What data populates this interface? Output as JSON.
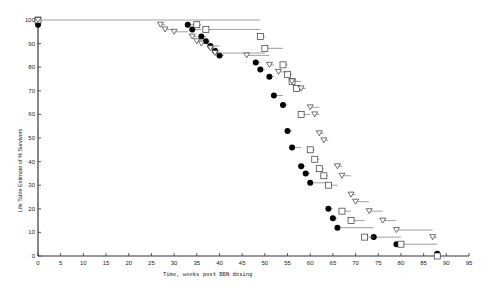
{
  "chart_data": {
    "type": "scatter",
    "title": "",
    "xlabel": "Time, weeks post BBN dosing",
    "ylabel": "Life Table Estimate of % Survivors",
    "xlim": [
      0,
      95
    ],
    "ylim": [
      0,
      100
    ],
    "x_ticks": [
      0,
      5,
      10,
      15,
      20,
      25,
      30,
      35,
      40,
      45,
      50,
      55,
      60,
      65,
      70,
      75,
      80,
      85,
      90,
      95
    ],
    "y_ticks": [
      0,
      10,
      20,
      30,
      40,
      50,
      60,
      70,
      80,
      90,
      100
    ],
    "grid": false,
    "legend": null,
    "series": [
      {
        "name": "filled-circle",
        "marker": "circle",
        "points": [
          {
            "x": 0,
            "y": 98,
            "end": 0
          },
          {
            "x": 33,
            "y": 98,
            "end": 35
          },
          {
            "x": 34,
            "y": 96,
            "end": 36
          },
          {
            "x": 36,
            "y": 93,
            "end": 37
          },
          {
            "x": 37,
            "y": 91,
            "end": 38
          },
          {
            "x": 38,
            "y": 89,
            "end": 40
          },
          {
            "x": 39,
            "y": 87,
            "end": 40
          },
          {
            "x": 40,
            "y": 85,
            "end": 41
          },
          {
            "x": 48,
            "y": 82,
            "end": 49
          },
          {
            "x": 49,
            "y": 79,
            "end": 50
          },
          {
            "x": 51,
            "y": 76,
            "end": 52
          },
          {
            "x": 52,
            "y": 68,
            "end": 54
          },
          {
            "x": 54,
            "y": 64,
            "end": 55
          },
          {
            "x": 55,
            "y": 53,
            "end": 56
          },
          {
            "x": 56,
            "y": 46,
            "end": 58
          },
          {
            "x": 58,
            "y": 38,
            "end": 59
          },
          {
            "x": 59,
            "y": 35,
            "end": 60
          },
          {
            "x": 60,
            "y": 31,
            "end": 64
          },
          {
            "x": 64,
            "y": 20,
            "end": 65
          },
          {
            "x": 65,
            "y": 16,
            "end": 66
          },
          {
            "x": 66,
            "y": 12,
            "end": 74
          },
          {
            "x": 74,
            "y": 8,
            "end": 80
          },
          {
            "x": 79,
            "y": 5,
            "end": 80
          },
          {
            "x": 88,
            "y": 1,
            "end": 88
          }
        ]
      },
      {
        "name": "open-square",
        "marker": "square",
        "points": [
          {
            "x": 0,
            "y": 100,
            "end": 49
          },
          {
            "x": 35,
            "y": 98,
            "end": 36
          },
          {
            "x": 37,
            "y": 96,
            "end": 49
          },
          {
            "x": 49,
            "y": 93,
            "end": 50
          },
          {
            "x": 50,
            "y": 88,
            "end": 54
          },
          {
            "x": 54,
            "y": 81,
            "end": 55
          },
          {
            "x": 55,
            "y": 77,
            "end": 56
          },
          {
            "x": 56,
            "y": 74,
            "end": 57
          },
          {
            "x": 57,
            "y": 71,
            "end": 58
          },
          {
            "x": 58,
            "y": 60,
            "end": 60
          },
          {
            "x": 60,
            "y": 45,
            "end": 61
          },
          {
            "x": 61,
            "y": 41,
            "end": 62
          },
          {
            "x": 62,
            "y": 37,
            "end": 63
          },
          {
            "x": 63,
            "y": 34,
            "end": 64
          },
          {
            "x": 64,
            "y": 30,
            "end": 66
          },
          {
            "x": 67,
            "y": 19,
            "end": 69
          },
          {
            "x": 69,
            "y": 15,
            "end": 72
          },
          {
            "x": 72,
            "y": 8,
            "end": 74
          },
          {
            "x": 80,
            "y": 5,
            "end": 88
          },
          {
            "x": 88,
            "y": 0,
            "end": 88
          }
        ]
      },
      {
        "name": "open-triangle",
        "marker": "triangle-down",
        "points": [
          {
            "x": 0,
            "y": 100,
            "end": 0
          },
          {
            "x": 27,
            "y": 98,
            "end": 28
          },
          {
            "x": 28,
            "y": 96,
            "end": 30
          },
          {
            "x": 30,
            "y": 95,
            "end": 33
          },
          {
            "x": 34,
            "y": 93,
            "end": 35
          },
          {
            "x": 35,
            "y": 91,
            "end": 36
          },
          {
            "x": 36,
            "y": 90,
            "end": 37
          },
          {
            "x": 38,
            "y": 88,
            "end": 39
          },
          {
            "x": 39,
            "y": 86,
            "end": 50
          },
          {
            "x": 46,
            "y": 85,
            "end": 51
          },
          {
            "x": 51,
            "y": 81,
            "end": 52
          },
          {
            "x": 53,
            "y": 78,
            "end": 55
          },
          {
            "x": 56,
            "y": 74,
            "end": 58
          },
          {
            "x": 58,
            "y": 71,
            "end": 59
          },
          {
            "x": 60,
            "y": 63,
            "end": 62
          },
          {
            "x": 61,
            "y": 60,
            "end": 62
          },
          {
            "x": 62,
            "y": 52,
            "end": 63
          },
          {
            "x": 63,
            "y": 49,
            "end": 64
          },
          {
            "x": 66,
            "y": 38,
            "end": 67
          },
          {
            "x": 67,
            "y": 34,
            "end": 69
          },
          {
            "x": 69,
            "y": 26,
            "end": 70
          },
          {
            "x": 70,
            "y": 23,
            "end": 73
          },
          {
            "x": 73,
            "y": 19,
            "end": 76
          },
          {
            "x": 76,
            "y": 15,
            "end": 79
          },
          {
            "x": 79,
            "y": 11,
            "end": 87
          },
          {
            "x": 87,
            "y": 8,
            "end": 88
          }
        ]
      }
    ]
  }
}
